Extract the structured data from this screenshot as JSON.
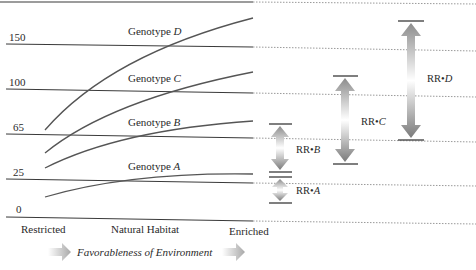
{
  "diagram": {
    "type": "reaction-range",
    "title": "",
    "y_axis": {
      "ticks": [
        {
          "label": "150",
          "value": 150
        },
        {
          "label": "100",
          "value": 100
        },
        {
          "label": "65",
          "value": 65
        },
        {
          "label": "25",
          "value": 25
        },
        {
          "label": "0",
          "value": 0
        }
      ]
    },
    "x_axis": {
      "categories": [
        "Restricted",
        "Natural Habitat",
        "Enriched"
      ],
      "title": "Favorableness of Environment"
    },
    "curves": [
      {
        "name": "Genotype D",
        "prefix": "Genotype ",
        "letter": "D"
      },
      {
        "name": "Genotype C",
        "prefix": "Genotype ",
        "letter": "C"
      },
      {
        "name": "Genotype B",
        "prefix": "Genotype ",
        "letter": "B"
      },
      {
        "name": "Genotype A",
        "prefix": "Genotype ",
        "letter": "A"
      }
    ],
    "reaction_ranges": [
      {
        "label": "RR•",
        "letter": "A"
      },
      {
        "label": "RR•",
        "letter": "B"
      },
      {
        "label": "RR•",
        "letter": "C"
      },
      {
        "label": "RR•",
        "letter": "D"
      }
    ],
    "colors": {
      "line": "#3a3a3a",
      "curve": "#555555",
      "dotted": "#9a9a9a",
      "arrow_dark": "#7a7a7a",
      "arrow_light": "#ffffff"
    }
  }
}
